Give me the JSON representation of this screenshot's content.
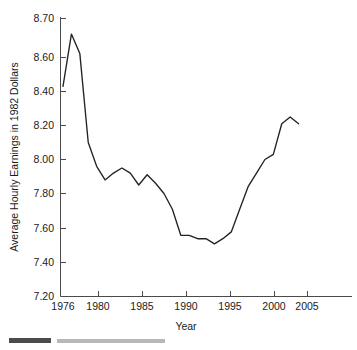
{
  "chart_data": {
    "type": "line",
    "title": "",
    "xlabel": "Year",
    "ylabel": "Average Hourly Earnings in 1982 Dollars",
    "xlim": [
      1975.4,
      2005.8
    ],
    "ylim": [
      7.2,
      8.7
    ],
    "grid": false,
    "legend": null,
    "xticks": [
      1976,
      1980,
      1985,
      1990,
      1995,
      2000,
      2005
    ],
    "xtick_labels": [
      "1976",
      "1980",
      "1985",
      "1990",
      "1995",
      "2000",
      "2005"
    ],
    "yticks": [
      7.2,
      7.4,
      7.6,
      7.8,
      8.0,
      8.2,
      8.4,
      8.6,
      8.7
    ],
    "ytick_labels": [
      "7.20",
      "7.40",
      "7.60",
      "7.80",
      "8.00",
      "8.20",
      "8.40",
      "8.60",
      "8.70"
    ],
    "y_axis_note": "top segment 8.60-8.70 compressed to same spacing as 0.20 steps",
    "series": [
      {
        "name": "Average Hourly Earnings",
        "color": "#222222",
        "x": [
          1976,
          1977,
          1978,
          1979,
          1980,
          1981,
          1982,
          1983,
          1984,
          1985,
          1986,
          1987,
          1988,
          1989,
          1990,
          1991,
          1992,
          1993,
          1994,
          1995,
          1996,
          1997,
          1998,
          1999,
          2000,
          2001,
          2002,
          2003,
          2004
        ],
        "values": [
          8.43,
          8.66,
          8.61,
          8.1,
          7.96,
          7.88,
          7.92,
          7.95,
          7.92,
          7.85,
          7.91,
          7.86,
          7.8,
          7.71,
          7.56,
          7.56,
          7.54,
          7.54,
          7.51,
          7.54,
          7.58,
          7.71,
          7.84,
          7.92,
          8.0,
          8.03,
          8.21,
          8.25,
          8.21
        ]
      }
    ]
  },
  "axis": {
    "y_title": "Average Hourly Earnings in 1982 Dollars",
    "x_title": "Year"
  },
  "ticks": {
    "y": [
      "8.70",
      "8.60",
      "8.40",
      "8.20",
      "8.00",
      "7.80",
      "7.60",
      "7.40",
      "7.20"
    ],
    "x": [
      "1976",
      "1980",
      "1985",
      "1990",
      "1995",
      "2000",
      "2005"
    ]
  },
  "caption": {
    "partial_text": ""
  }
}
